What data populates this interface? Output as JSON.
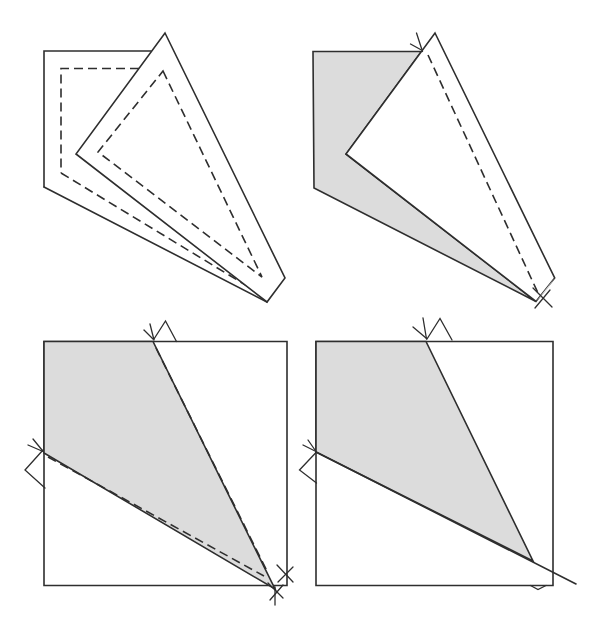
{
  "figure": {
    "kind": "origami-fold-instruction-diagram",
    "canvas": {
      "width": 605,
      "height": 627
    },
    "colors": {
      "background": "#ffffff",
      "line": "#2e2e2e",
      "shade": "#dcdcdc",
      "paper": "#ffffff"
    },
    "style": {
      "stroke_width": 1.6,
      "mark_stroke_width": 1.3,
      "dash": "9 5"
    },
    "panels": [
      {
        "id": "panel-top-left-unfolded-paper-with-creases",
        "shapes": [
          {
            "name": "paper-edge-top-left",
            "kind": "polyline",
            "points": [
              [
                151,
                51
              ],
              [
                44,
                51
              ],
              [
                44,
                187
              ]
            ],
            "fill": "none",
            "stroke": "solid"
          },
          {
            "name": "paper-edge-bottom",
            "kind": "line",
            "from": [
              44,
              187
            ],
            "to": [
              267,
              302
            ],
            "stroke": "solid"
          },
          {
            "name": "crease-dashed-top-left",
            "kind": "polyline",
            "points": [
              [
                139,
                68.5
              ],
              [
                61,
                68.5
              ],
              [
                61,
                173
              ]
            ],
            "fill": "none",
            "stroke": "dashed"
          },
          {
            "name": "crease-dashed-bottom",
            "kind": "line",
            "from": [
              61,
              173
            ],
            "to": [
              257,
              292
            ],
            "stroke": "dashed"
          },
          {
            "name": "folded-flap-outline",
            "kind": "polygon",
            "points": [
              [
                165,
                33
              ],
              [
                285,
                278
              ],
              [
                267,
                302
              ],
              [
                76,
                154
              ]
            ],
            "fill": "paper",
            "stroke": "solid"
          },
          {
            "name": "crease-dashed-flap-triangle",
            "kind": "polygon",
            "points": [
              [
                163,
                71
              ],
              [
                262,
                277
              ],
              [
                98,
                152
              ]
            ],
            "fill": "none",
            "stroke": "dashed"
          }
        ]
      },
      {
        "id": "panel-top-right-folded-paper-shaded",
        "shapes": [
          {
            "name": "paper-back-shaded",
            "kind": "polygon",
            "points": [
              [
                313,
                51.5
              ],
              [
                421.4,
                51.5
              ],
              [
                346,
                154
              ],
              [
                536,
                301.5
              ],
              [
                314,
                188
              ]
            ],
            "fill": "shade",
            "stroke": "solid"
          },
          {
            "name": "folded-flap-front",
            "kind": "polygon",
            "points": [
              [
                435,
                33
              ],
              [
                554.7,
                278
              ],
              [
                536,
                301.5
              ],
              [
                346,
                154
              ]
            ],
            "fill": "paper",
            "stroke": "solid"
          },
          {
            "name": "tip-shaded-sliver",
            "kind": "polygon",
            "points": [
              [
                536,
                301.5
              ],
              [
                554.7,
                278
              ],
              [
                546,
                291
              ]
            ],
            "fill": "shade",
            "stroke": "none"
          },
          {
            "name": "crease-dashed-line",
            "kind": "line",
            "from": [
              428,
              55
            ],
            "to": [
              538,
              293
            ],
            "stroke": "dashed"
          },
          {
            "name": "pinch-mark-top",
            "kind": "polyline",
            "points": [
              [
                416.5,
                33
              ],
              [
                422.5,
                51.5
              ]
            ],
            "fill": "none",
            "stroke": "mark"
          },
          {
            "name": "pinch-mark-top-barb",
            "kind": "polyline",
            "points": [
              [
                410.5,
                44
              ],
              [
                420.5,
                49.5
              ]
            ],
            "fill": "none",
            "stroke": "mark"
          },
          {
            "name": "cross-mark-tip-a",
            "kind": "line",
            "from": [
              533,
              288
            ],
            "to": [
              552,
              307
            ],
            "stroke": "mark"
          },
          {
            "name": "cross-mark-tip-b",
            "kind": "line",
            "from": [
              550,
              290
            ],
            "to": [
              535,
              308
            ],
            "stroke": "mark"
          }
        ]
      },
      {
        "id": "panel-bottom-left-square-with-shaded-fold-and-creases",
        "shapes": [
          {
            "name": "paper-square-outline",
            "kind": "polygon",
            "points": [
              [
                44,
                341.5
              ],
              [
                287,
                341.5
              ],
              [
                287,
                585.5
              ],
              [
                44,
                585.5
              ]
            ],
            "fill": "none",
            "stroke": "solid"
          },
          {
            "name": "fold-region-shaded",
            "kind": "polygon",
            "points": [
              [
                44,
                341.5
              ],
              [
                153,
                341.5
              ],
              [
                275,
                589
              ],
              [
                44,
                453
              ]
            ],
            "fill": "shade",
            "stroke": "solid"
          },
          {
            "name": "crease-dashed-right",
            "kind": "line",
            "from": [
              156,
              348
            ],
            "to": [
              268,
              573
            ],
            "stroke": "dashed"
          },
          {
            "name": "crease-dashed-left",
            "kind": "line",
            "from": [
              48,
              457
            ],
            "to": [
              264,
              576
            ],
            "stroke": "dashed"
          },
          {
            "name": "arrowhead-mark-top",
            "kind": "polyline",
            "points": [
              [
                154,
                339
              ],
              [
                165.5,
                321
              ],
              [
                176.5,
                341.5
              ]
            ],
            "fill": "none",
            "stroke": "mark"
          },
          {
            "name": "tick-mark-top-a",
            "kind": "line",
            "from": [
              150,
              324
            ],
            "to": [
              154,
              340
            ],
            "stroke": "mark"
          },
          {
            "name": "tick-mark-top-b",
            "kind": "line",
            "from": [
              144,
              330
            ],
            "to": [
              153,
              339
            ],
            "stroke": "mark"
          },
          {
            "name": "arrowhead-mark-left",
            "kind": "polyline",
            "points": [
              [
                43,
                450
              ],
              [
                25,
                470
              ],
              [
                45,
                488
              ]
            ],
            "fill": "none",
            "stroke": "mark"
          },
          {
            "name": "tick-mark-left-a",
            "kind": "line",
            "from": [
              28,
              445
            ],
            "to": [
              43,
              451.5
            ],
            "stroke": "mark"
          },
          {
            "name": "tick-mark-left-b",
            "kind": "line",
            "from": [
              33,
              439
            ],
            "to": [
              42,
              450
            ],
            "stroke": "mark"
          },
          {
            "name": "cross-mark-corner-a1",
            "kind": "line",
            "from": [
              277,
              565
            ],
            "to": [
              293,
              582
            ],
            "stroke": "mark"
          },
          {
            "name": "cross-mark-corner-a2",
            "kind": "line",
            "from": [
              293,
              567
            ],
            "to": [
              278,
              582
            ],
            "stroke": "mark"
          },
          {
            "name": "cross-mark-corner-b1",
            "kind": "line",
            "from": [
              268,
              583
            ],
            "to": [
              283,
              598
            ],
            "stroke": "mark"
          },
          {
            "name": "cross-mark-corner-b2",
            "kind": "line",
            "from": [
              283,
              585
            ],
            "to": [
              270,
              600
            ],
            "stroke": "mark"
          },
          {
            "name": "cross-mark-corner-b3",
            "kind": "line",
            "from": [
              275,
              587
            ],
            "to": [
              275,
              605
            ],
            "stroke": "mark"
          }
        ]
      },
      {
        "id": "panel-bottom-right-square-with-shaded-fold",
        "shapes": [
          {
            "name": "paper-square-outline",
            "kind": "polygon",
            "points": [
              [
                316,
                341.5
              ],
              [
                553,
                341.5
              ],
              [
                553,
                585.5
              ],
              [
                316,
                585.5
              ]
            ],
            "fill": "none",
            "stroke": "solid"
          },
          {
            "name": "fold-region-shaded",
            "kind": "polygon",
            "points": [
              [
                316,
                341.5
              ],
              [
                426,
                341.5
              ],
              [
                533,
                561
              ],
              [
                316,
                452
              ]
            ],
            "fill": "shade",
            "stroke": "solid"
          },
          {
            "name": "fold-line-extended",
            "kind": "line",
            "from": [
              316,
              452
            ],
            "to": [
              576,
              584
            ],
            "stroke": "solid"
          },
          {
            "name": "arrowhead-mark-top",
            "kind": "polyline",
            "points": [
              [
                427,
                339
              ],
              [
                440,
                318.5
              ],
              [
                452,
                340
              ]
            ],
            "fill": "none",
            "stroke": "mark"
          },
          {
            "name": "tick-mark-top-a",
            "kind": "line",
            "from": [
              423,
              318
            ],
            "to": [
              426.5,
              339
            ],
            "stroke": "mark"
          },
          {
            "name": "tick-mark-top-b",
            "kind": "line",
            "from": [
              413,
              327
            ],
            "to": [
              426,
              338
            ],
            "stroke": "mark"
          },
          {
            "name": "arrowhead-mark-left",
            "kind": "polyline",
            "points": [
              [
                316.5,
                452
              ],
              [
                299.5,
                470
              ],
              [
                316.5,
                483
              ]
            ],
            "fill": "none",
            "stroke": "mark"
          },
          {
            "name": "tick-mark-left-a",
            "kind": "line",
            "from": [
              303,
              445
            ],
            "to": [
              316,
              451.5
            ],
            "stroke": "mark"
          },
          {
            "name": "tick-mark-left-b",
            "kind": "line",
            "from": [
              308,
              440
            ],
            "to": [
              315,
              450
            ],
            "stroke": "mark"
          },
          {
            "name": "notch-mark-bottom",
            "kind": "polyline",
            "points": [
              [
                530.5,
                585.5
              ],
              [
                538,
                589.5
              ],
              [
                546,
                585.5
              ]
            ],
            "fill": "none",
            "stroke": "mark"
          }
        ]
      }
    ]
  }
}
